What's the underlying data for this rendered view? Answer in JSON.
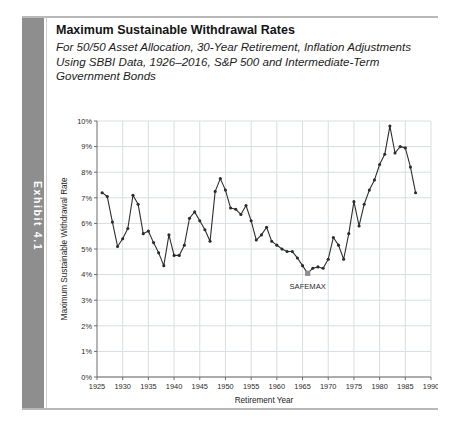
{
  "exhibit": {
    "tab_label": "Exhibit 4.1",
    "title": "Maximum Sustainable Withdrawal Rates",
    "subtitle": "For 50/50 Asset Allocation, 30-Year Retirement, Inflation Adjustments Using SBBI Data, 1926–2016, S&P 500 and Intermediate-Term Government Bonds"
  },
  "chart_data": {
    "type": "line",
    "title": "",
    "xlabel": "Retirement Year",
    "ylabel": "Maximum Sustainable Withdrawal Rate",
    "xlim": [
      1925,
      1990
    ],
    "ylim": [
      0,
      10
    ],
    "xticks": [
      1925,
      1930,
      1935,
      1940,
      1945,
      1950,
      1955,
      1960,
      1965,
      1970,
      1975,
      1980,
      1985,
      1990
    ],
    "xticklabels": [
      "1925",
      "1930",
      "1935",
      "1940",
      "1945",
      "1950",
      "1955",
      "1960",
      "1965",
      "1970",
      "1975",
      "1980",
      "1985",
      "1990"
    ],
    "yticks": [
      0,
      1,
      2,
      3,
      4,
      5,
      6,
      7,
      8,
      9,
      10
    ],
    "yticklabels": [
      "0%",
      "1%",
      "2%",
      "3%",
      "4%",
      "5%",
      "6%",
      "7%",
      "8%",
      "9%",
      "10%"
    ],
    "grid": true,
    "legend": false,
    "markers": true,
    "line_color": "#2e2e2e",
    "grid_color": "#d8dde3",
    "annotations": [
      {
        "label": "SAFEMAX",
        "x": 1966,
        "y": 4.05,
        "marker": true
      }
    ],
    "x": [
      1926,
      1927,
      1928,
      1929,
      1930,
      1931,
      1932,
      1933,
      1934,
      1935,
      1936,
      1937,
      1938,
      1939,
      1940,
      1941,
      1942,
      1943,
      1944,
      1945,
      1946,
      1947,
      1948,
      1949,
      1950,
      1951,
      1952,
      1953,
      1954,
      1955,
      1956,
      1957,
      1958,
      1959,
      1960,
      1961,
      1962,
      1963,
      1964,
      1965,
      1966,
      1967,
      1968,
      1969,
      1970,
      1971,
      1972,
      1973,
      1974,
      1975,
      1976,
      1977,
      1978,
      1979,
      1980,
      1981,
      1982,
      1983,
      1984,
      1985,
      1986,
      1987
    ],
    "values": [
      7.2,
      7.05,
      6.05,
      5.1,
      5.4,
      5.8,
      7.1,
      6.75,
      5.6,
      5.7,
      5.25,
      4.85,
      4.35,
      5.55,
      4.75,
      4.75,
      5.15,
      6.2,
      6.45,
      6.1,
      5.75,
      5.3,
      7.25,
      7.75,
      7.3,
      6.6,
      6.55,
      6.35,
      6.7,
      6.1,
      5.35,
      5.55,
      5.85,
      5.3,
      5.15,
      5.0,
      4.9,
      4.9,
      4.65,
      4.35,
      4.05,
      4.25,
      4.3,
      4.25,
      4.6,
      5.45,
      5.15,
      4.6,
      5.6,
      6.85,
      5.9,
      6.75,
      7.3,
      7.7,
      8.3,
      8.7,
      9.8,
      8.75,
      9.0,
      8.95,
      8.2,
      7.2
    ]
  }
}
